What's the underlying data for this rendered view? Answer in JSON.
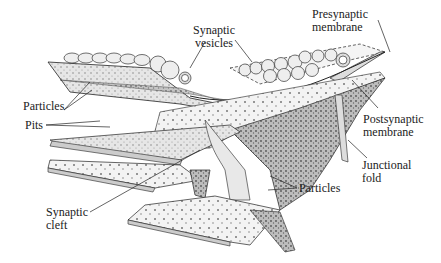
{
  "diagram": {
    "labels": {
      "synaptic_vesicles": [
        "Synaptic",
        "vesicles"
      ],
      "presynaptic_membrane": [
        "Presynaptic",
        "membrane"
      ],
      "postsynaptic_membrane": [
        "Postsynaptic",
        "membrane"
      ],
      "particles_left": "Particles",
      "pits": "Pits",
      "junctional_fold": [
        "Junctional",
        "fold"
      ],
      "particles_bottom": "Particles",
      "synaptic_cleft": [
        "Synaptic",
        "cleft"
      ]
    },
    "colors": {
      "line": "#222222",
      "membrane_fill": "#d9d9d9",
      "dark_stipple": "#a8a8a8",
      "vesicle": "#eeeeee"
    }
  }
}
